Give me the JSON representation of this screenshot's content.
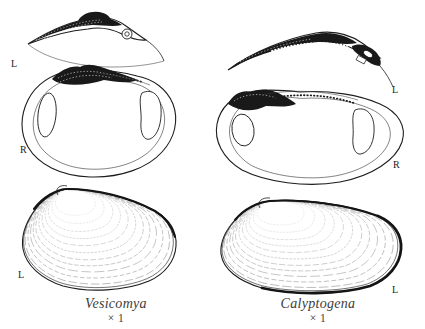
{
  "figure": {
    "background": "#ffffff",
    "ink": "#1d1d1d",
    "caption_color": "#3c3c3c",
    "columns": [
      {
        "genus": "Vesicomya",
        "magnification": "× 1",
        "views": {
          "hinge": {
            "label": "L"
          },
          "interior": {
            "label": "R"
          },
          "exterior": {
            "label": "L"
          }
        }
      },
      {
        "genus": "Calyptogena",
        "magnification": "× 1",
        "views": {
          "hinge": {
            "label": "L"
          },
          "interior": {
            "label": "R"
          },
          "exterior": {
            "label": "L"
          }
        }
      }
    ]
  }
}
